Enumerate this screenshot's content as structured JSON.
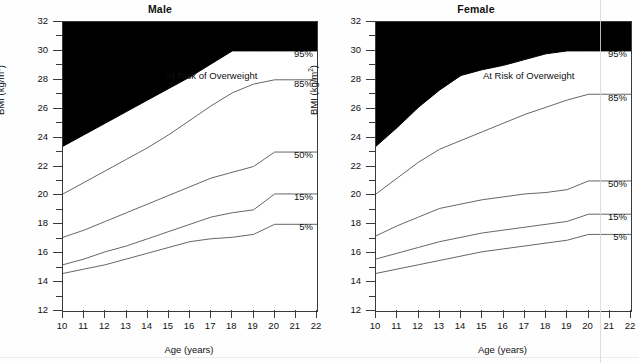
{
  "figure": {
    "axis": {
      "ylabel": "BMI (kg/m",
      "ylabel_sup": "2",
      "ylabel_close": ")",
      "xlabel": "Age (years)",
      "y_ticks_major": [
        12,
        14,
        16,
        18,
        20,
        22,
        24,
        26,
        28,
        30,
        32
      ],
      "y_ticks_minor": [
        13,
        15,
        17,
        19,
        21,
        23,
        25,
        27,
        29,
        31
      ],
      "x_ticks": [
        10,
        11,
        12,
        13,
        14,
        15,
        16,
        17,
        18,
        19,
        20,
        21,
        22
      ],
      "ylim": [
        12,
        32
      ],
      "xlim": [
        10,
        22
      ]
    },
    "annotation_risk": "At Risk of Overweight",
    "curve_labels": [
      "95%",
      "85%",
      "50%",
      "15%",
      "5%"
    ],
    "colors": {
      "obese_fill": "#000000",
      "curve": "#555555",
      "axis": "#3a3a3a",
      "background": "#ffffff"
    }
  },
  "chart_data": [
    {
      "type": "line",
      "title": "Male",
      "xlabel": "Age (years)",
      "ylabel": "BMI (kg/m2)",
      "xlim": [
        10,
        22
      ],
      "ylim": [
        12,
        32
      ],
      "grid": false,
      "x": [
        10,
        11,
        12,
        13,
        14,
        15,
        16,
        17,
        18,
        19,
        20,
        21,
        22
      ],
      "series": [
        {
          "name": "95%",
          "label": "95%",
          "values": [
            23.4,
            24.2,
            25.0,
            25.8,
            26.6,
            27.4,
            28.2,
            29.1,
            30.0,
            30.0,
            30.0,
            30.0,
            30.0
          ]
        },
        {
          "name": "85%",
          "label": "85%",
          "values": [
            20.1,
            20.9,
            21.7,
            22.5,
            23.3,
            24.2,
            25.2,
            26.2,
            27.1,
            27.7,
            28.0,
            28.0,
            28.0
          ]
        },
        {
          "name": "50%",
          "label": "50%",
          "values": [
            17.1,
            17.6,
            18.2,
            18.8,
            19.4,
            20.0,
            20.6,
            21.2,
            21.6,
            22.0,
            23.0,
            23.0,
            23.0
          ]
        },
        {
          "name": "15%",
          "label": "15%",
          "values": [
            15.2,
            15.6,
            16.1,
            16.5,
            17.0,
            17.5,
            18.0,
            18.5,
            18.8,
            19.0,
            20.1,
            20.1,
            20.1
          ]
        },
        {
          "name": "5%",
          "label": "5%",
          "values": [
            14.6,
            14.9,
            15.2,
            15.6,
            16.0,
            16.4,
            16.8,
            17.0,
            17.1,
            17.3,
            18.0,
            18.0,
            18.0
          ]
        }
      ]
    },
    {
      "type": "line",
      "title": "Female",
      "xlabel": "Age (years)",
      "ylabel": "BMI (kg/m2)",
      "xlim": [
        10,
        22
      ],
      "ylim": [
        12,
        32
      ],
      "grid": false,
      "x": [
        10,
        11,
        12,
        13,
        14,
        15,
        16,
        17,
        18,
        19,
        20,
        21,
        22
      ],
      "series": [
        {
          "name": "95%",
          "label": "95%",
          "values": [
            23.4,
            24.7,
            26.1,
            27.3,
            28.3,
            28.7,
            29.0,
            29.4,
            29.8,
            30.0,
            30.0,
            30.0,
            30.0
          ]
        },
        {
          "name": "85%",
          "label": "85%",
          "values": [
            20.1,
            21.2,
            22.3,
            23.2,
            23.8,
            24.4,
            25.0,
            25.6,
            26.1,
            26.6,
            27.0,
            27.0,
            27.0
          ]
        },
        {
          "name": "50%",
          "label": "50%",
          "values": [
            17.2,
            17.9,
            18.5,
            19.1,
            19.4,
            19.7,
            19.9,
            20.1,
            20.2,
            20.4,
            21.0,
            21.0,
            21.0
          ]
        },
        {
          "name": "15%",
          "label": "15%",
          "values": [
            15.6,
            16.0,
            16.4,
            16.8,
            17.1,
            17.4,
            17.6,
            17.8,
            18.0,
            18.2,
            18.7,
            18.7,
            18.7
          ]
        },
        {
          "name": "5%",
          "label": "5%",
          "values": [
            14.6,
            14.9,
            15.2,
            15.5,
            15.8,
            16.1,
            16.3,
            16.5,
            16.7,
            16.9,
            17.3,
            17.3,
            17.3
          ]
        }
      ]
    }
  ]
}
